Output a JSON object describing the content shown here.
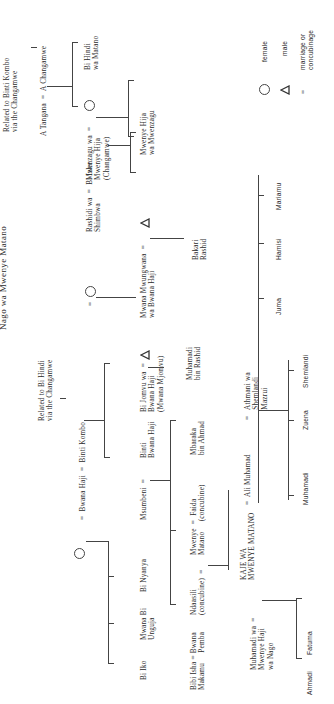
{
  "title": "Nago wa Mwenye Matano",
  "notes": {
    "related_kombo": "Related to Binti Kombo\nvia the Changamwe",
    "related_hindi": "Related to Bi Hindi\nvia the Changamwe"
  },
  "gen1": {
    "tangana": "A Tangana  =  A Changamwe",
    "bwana_haji": "=  Bwana Haji  =  Binti Kombo"
  },
  "gen2": {
    "bi_hindi": "Bi Hindi\nwa Matano",
    "mwenzagu": "Mwenzagu wa  =\nMwenye Hija\n(Changamwe)",
    "mwana_mwungwana": "Mwana Mwungwana  =\nwa Bwana Haji",
    "rashidi": "Rashidi wa  =  Bi Izhe\nShimbwa",
    "bi_jomvu": "Bi Jomvu wa  =\nBwana Haji\n(Mwana Mjomvu)",
    "binti_bwana_haji": "Binti\nBwana Haji",
    "msumbeni": "Msumbeni  =",
    "bi_nyanya": "Bi Nyanya",
    "mwana_bi_unguja": "Mwana Bi\nUnguja",
    "bi_iko": "Bi Iko",
    "eq_circle": "="
  },
  "gen3": {
    "mwenye_hija_mwenzagu": "Mwenye Hija\nwa Mwenzagu",
    "bi_izhe_child": "",
    "bakari": "Bakari\nRashid",
    "muhamadi_rashid": "Muhamadi\nbin Rashid",
    "mbaraka": "Mbaraka\nbin Ahmad",
    "mwenye_matano": "Mwenye  =  Faida\nMatano     (concubine)",
    "ndaasili": "Ndaasili\n(concubine)  =",
    "bibi_isha": "Bibi Isha = Bwana\nMakamu     Pemba"
  },
  "gen4": {
    "kaje": "KAJE WA\nMWENYE MATANO",
    "muhamadi_wa": "Muhamadi wa  =\nMwenye Haji\nwa Nago",
    "ali_muhamad": "=  Ali Muhamad",
    "athmani": "=   Athmani wa\n     Shemlandi\n     Mazrui"
  },
  "gen5": {
    "juma": "Juma",
    "hamisi": "Hamisi",
    "mariamu": "Mariamu",
    "muhamadi": "Muhamadi",
    "zuena": "Zuena",
    "shemlandi": "Shemlandi",
    "ahmadi": "Ahmadi",
    "fatuma": "Fatuma"
  },
  "legend": {
    "female_symbol": "circle",
    "female": "female",
    "male_symbol": "triangle",
    "male": "male",
    "marriage_symbol": "=",
    "marriage": "marriage or\nconcubinage"
  }
}
